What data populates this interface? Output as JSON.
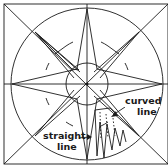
{
  "diagram": {
    "labels": {
      "curved_line_1": "curved",
      "curved_line_2": "line",
      "straight_line_1": "straight",
      "straight_line_2": "line"
    },
    "colors": {
      "stroke": "#1a1a1a",
      "background": "#ffffff"
    }
  }
}
